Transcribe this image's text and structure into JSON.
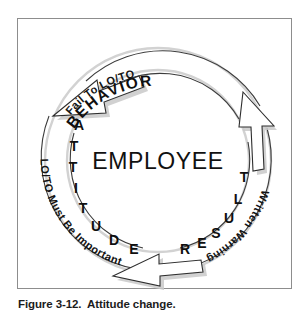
{
  "figure": {
    "caption": "Figure 3-12.  Attitude change.",
    "center_label": "EMPLOYEE",
    "border_color": "#8d8d8d",
    "ink_color": "#1a1a1a",
    "shadow_color": "#c9c9c9"
  },
  "cycle": {
    "stages": [
      {
        "id": "behavior",
        "inner_label": "BEHAVIOR",
        "outer_label": "Fail To LO/TO",
        "position": "top"
      },
      {
        "id": "result",
        "inner_label": "RESULT",
        "outer_label": "Written Warning",
        "position": "right"
      },
      {
        "id": "attitude",
        "inner_label": "ATTITUDE",
        "outer_label": "LO/TO Must Be Important",
        "position": "left"
      }
    ],
    "attitude_letters": [
      "A",
      "T",
      "T",
      "I",
      "T",
      "U",
      "D",
      "E"
    ],
    "result_letters": [
      "R",
      "E",
      "S",
      "U",
      "L",
      "T"
    ],
    "arrows": [
      {
        "id": "arrow-top-right",
        "direction": "clockwise-down-right"
      },
      {
        "id": "arrow-bottom",
        "direction": "counter-left"
      },
      {
        "id": "arrow-upper-left",
        "direction": "up-right"
      }
    ]
  }
}
